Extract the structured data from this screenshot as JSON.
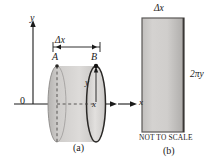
{
  "figure": {
    "note": "NOT TO SCALE",
    "stroke_color": "#1a1a1a",
    "shell_fill_light": "#d8d6d4",
    "shell_fill_dark": "#9a9896",
    "rect_fill_light": "#cfcecd",
    "rect_fill_dark": "#a9a7a6"
  },
  "panel_a": {
    "caption": "(a)",
    "y_axis_label": "y",
    "origin_label": "0",
    "x_axis_label": "x",
    "delta_x_label": "Δx",
    "point_a_label": "A",
    "point_b_label": "B",
    "radius_label": "y",
    "abscissa_label": "x"
  },
  "panel_b": {
    "caption": "(b)",
    "width_label": "Δx",
    "height_label": "2πy",
    "x_axis_label": "x",
    "not_to_scale": "NOT TO SCALE"
  }
}
